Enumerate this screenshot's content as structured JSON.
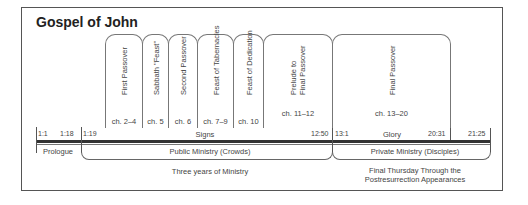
{
  "title": "Gospel of John",
  "boxes": [
    {
      "label": "First Passover",
      "ch": "ch. 2–4"
    },
    {
      "label": "Sabbath \"Feast\"",
      "ch": "ch. 5"
    },
    {
      "label": "Second Passover",
      "ch": "ch. 6"
    },
    {
      "label": "Feast of Tabernacles",
      "ch": "ch. 7–9"
    },
    {
      "label": "Feast of Dedication",
      "ch": "ch. 10"
    },
    {
      "label": "Prelude to",
      "label2": "Final Passover",
      "ch": "ch. 11–12"
    },
    {
      "label": "Final Passover",
      "ch": "ch. 13–20"
    }
  ],
  "refs": {
    "r1": "1:1",
    "r2": "1:18",
    "r3": "1:19",
    "r4": "12:50",
    "r5": "13:1",
    "r6": "20:31",
    "r7": "21:25"
  },
  "sections": {
    "signs": "Signs",
    "glory": "Glory",
    "prologue": "Prologue",
    "public": "Public Ministry (Crowds)",
    "private": "Private Ministry (Disciples)",
    "three_years": "Three years of Ministry",
    "final_line1": "Final Thursday Through the",
    "final_line2": "Postresurrection Appearances"
  }
}
